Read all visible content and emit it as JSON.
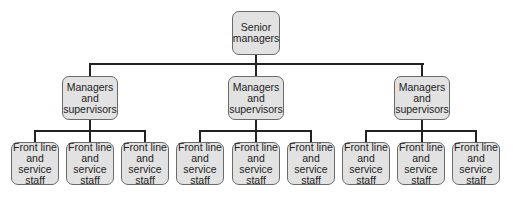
{
  "diagram": {
    "type": "organization-chart",
    "root": {
      "label": "Senior\nmanagers"
    },
    "managers": [
      {
        "label": "Managers\nand\nsupervisors",
        "staff": [
          {
            "label": "Front line\nand service\nstaff"
          },
          {
            "label": "Front line\nand service\nstaff"
          },
          {
            "label": "Front line\nand service\nstaff"
          }
        ]
      },
      {
        "label": "Managers\nand\nsupervisors",
        "staff": [
          {
            "label": "Front line\nand service\nstaff"
          },
          {
            "label": "Front line\nand service\nstaff"
          },
          {
            "label": "Front line\nand service\nstaff"
          }
        ]
      },
      {
        "label": "Managers\nand\nsupervisors",
        "staff": [
          {
            "label": "Front line\nand service\nstaff"
          },
          {
            "label": "Front line\nand service\nstaff"
          },
          {
            "label": "Front line\nand service\nstaff"
          }
        ]
      }
    ],
    "colors": {
      "box_fill": "#e2e2e2",
      "box_border": "#6a6a6a",
      "connector": "#222222",
      "text": "#222222"
    }
  }
}
